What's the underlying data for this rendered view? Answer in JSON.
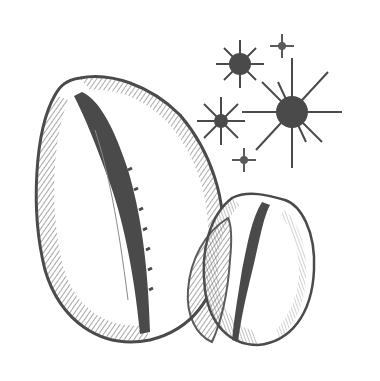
{
  "illustration": {
    "subject": "two cowrie shells with sparkling stars",
    "colors": {
      "background": "#ffffff",
      "ink": "#5a5a5a",
      "ink_dark": "#4a4a4a",
      "ink_light": "#8a8a8a"
    },
    "shells": [
      {
        "name": "large-cowrie-shell",
        "cx": 118,
        "cy": 218,
        "rx": 95,
        "ry": 150
      },
      {
        "name": "small-cowrie-shell",
        "cx": 265,
        "cy": 268,
        "rx": 60,
        "ry": 85
      }
    ],
    "stars": [
      {
        "name": "star-top-left",
        "cx": 240,
        "cy": 64,
        "r": 10,
        "ray": 24
      },
      {
        "name": "star-top-small",
        "cx": 282,
        "cy": 46,
        "r": 3,
        "ray": 12
      },
      {
        "name": "star-large",
        "cx": 292,
        "cy": 112,
        "r": 15,
        "ray": 55
      },
      {
        "name": "star-mid-left",
        "cx": 221,
        "cy": 121,
        "r": 6,
        "ray": 24
      },
      {
        "name": "star-bottom-small",
        "cx": 244,
        "cy": 160,
        "r": 3,
        "ray": 12
      }
    ]
  }
}
